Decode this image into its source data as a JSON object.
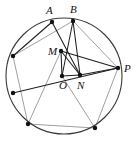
{
  "figure": {
    "canvas": {
      "width": 137,
      "height": 146
    },
    "background_color": "#ffffff",
    "stroke_dark": "#1d1d1d",
    "stroke_light": "#9a9a9a",
    "circle_color": "#3a3a3a",
    "dot_color": "#111111",
    "circle": {
      "cx": 64,
      "cy": 76,
      "r": 58
    },
    "points": [
      {
        "id": "A",
        "label": "A",
        "x": 52,
        "y": 22,
        "label_x": 46,
        "label_y": 14,
        "labeled": true,
        "on_circle": true
      },
      {
        "id": "B",
        "label": "B",
        "x": 73,
        "y": 21,
        "label_x": 70,
        "label_y": 13,
        "labeled": true,
        "on_circle": true
      },
      {
        "id": "P",
        "label": "P",
        "x": 118,
        "y": 68,
        "label_x": 124,
        "label_y": 72,
        "labeled": true,
        "on_circle": true
      },
      {
        "id": "M",
        "label": "M",
        "x": 61,
        "y": 51,
        "label_x": 48,
        "label_y": 55,
        "labeled": true,
        "on_circle": false
      },
      {
        "id": "O",
        "label": "O",
        "x": 62,
        "y": 76,
        "label_x": 59,
        "label_y": 89,
        "labeled": true,
        "on_circle": false
      },
      {
        "id": "N",
        "label": "N",
        "x": 80,
        "y": 75,
        "label_x": 77,
        "label_y": 89,
        "labeled": true,
        "on_circle": false
      },
      {
        "id": "Q1",
        "label": "",
        "x": 13,
        "y": 56,
        "label_x": 0,
        "label_y": 0,
        "labeled": false,
        "on_circle": true
      },
      {
        "id": "Q2",
        "label": "",
        "x": 13,
        "y": 93,
        "label_x": 0,
        "label_y": 0,
        "labeled": false,
        "on_circle": true
      },
      {
        "id": "Q3",
        "label": "",
        "x": 28,
        "y": 124,
        "label_x": 0,
        "label_y": 0,
        "labeled": false,
        "on_circle": true
      },
      {
        "id": "Q4",
        "label": "",
        "x": 95,
        "y": 128,
        "label_x": 0,
        "label_y": 0,
        "labeled": false,
        "on_circle": true
      }
    ],
    "segments_dark": [
      {
        "from": "A",
        "to": "Q1",
        "x1": 52,
        "y1": 22,
        "x2": 13,
        "y2": 56
      },
      {
        "from": "A",
        "to": "N",
        "x1": 52,
        "y1": 22,
        "x2": 80,
        "y2": 75
      },
      {
        "from": "B",
        "to": "O",
        "x1": 73,
        "y1": 21,
        "x2": 62,
        "y2": 76
      },
      {
        "from": "B",
        "to": "N",
        "x1": 73,
        "y1": 21,
        "x2": 80,
        "y2": 75
      },
      {
        "from": "M",
        "to": "P",
        "x1": 61,
        "y1": 51,
        "x2": 118,
        "y2": 68
      },
      {
        "from": "M",
        "to": "O",
        "x1": 61,
        "y1": 51,
        "x2": 62,
        "y2": 76
      },
      {
        "from": "M",
        "to": "N",
        "x1": 61,
        "y1": 51,
        "x2": 80,
        "y2": 75
      },
      {
        "from": "Q2",
        "to": "P",
        "x1": 13,
        "y1": 93,
        "x2": 118,
        "y2": 68
      },
      {
        "from": "N",
        "to": "P",
        "x1": 80,
        "y1": 75,
        "x2": 118,
        "y2": 68
      },
      {
        "from": "O",
        "to": "N",
        "x1": 62,
        "y1": 76,
        "x2": 80,
        "y2": 75
      }
    ],
    "segments_light": [
      {
        "from": "B",
        "to": "P",
        "x1": 73,
        "y1": 21,
        "x2": 118,
        "y2": 68
      },
      {
        "from": "Q1",
        "to": "B",
        "x1": 13,
        "y1": 56,
        "x2": 73,
        "y2": 21
      },
      {
        "from": "Q1",
        "to": "Q3",
        "x1": 13,
        "y1": 56,
        "x2": 28,
        "y2": 124
      },
      {
        "from": "Q3",
        "to": "Q4",
        "x1": 28,
        "y1": 124,
        "x2": 95,
        "y2": 128
      },
      {
        "from": "Q4",
        "to": "P",
        "x1": 95,
        "y1": 128,
        "x2": 118,
        "y2": 68
      },
      {
        "from": "O",
        "to": "Q4",
        "x1": 62,
        "y1": 76,
        "x2": 95,
        "y2": 128
      },
      {
        "from": "M",
        "to": "Q3",
        "x1": 61,
        "y1": 51,
        "x2": 28,
        "y2": 124
      }
    ]
  }
}
